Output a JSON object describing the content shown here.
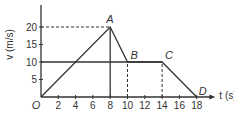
{
  "chart_data": {
    "type": "line",
    "title": "",
    "xlabel": "t (s)",
    "ylabel": "v (m/s)",
    "xlim": [
      0,
      19
    ],
    "ylim": [
      0,
      25
    ],
    "x_ticks": [
      2,
      4,
      6,
      8,
      10,
      12,
      14,
      16,
      18
    ],
    "y_ticks": [
      5,
      10,
      15,
      20
    ],
    "origin_label": "O",
    "grid": false,
    "series": [
      {
        "name": "velocity",
        "points": [
          {
            "label": "O",
            "t": 0,
            "v": 0
          },
          {
            "label": "A",
            "t": 8,
            "v": 20
          },
          {
            "label": "B",
            "t": 10,
            "v": 10
          },
          {
            "label": "C",
            "t": 14,
            "v": 10
          },
          {
            "label": "D",
            "t": 18,
            "v": 0
          }
        ]
      },
      {
        "name": "constant-10",
        "points": [
          {
            "t": 0,
            "v": 10
          },
          {
            "t": 14,
            "v": 10
          }
        ]
      }
    ],
    "guides": {
      "dashed_horizontal": [
        {
          "v": 20,
          "t_from": 0,
          "t_to": 8
        }
      ],
      "solid_vertical": [
        {
          "t": 8,
          "v_from": 0,
          "v_to": 20
        }
      ],
      "dashed_vertical": [
        {
          "t": 10,
          "v_from": 0,
          "v_to": 10
        },
        {
          "t": 14,
          "v_from": 0,
          "v_to": 10
        }
      ]
    }
  }
}
